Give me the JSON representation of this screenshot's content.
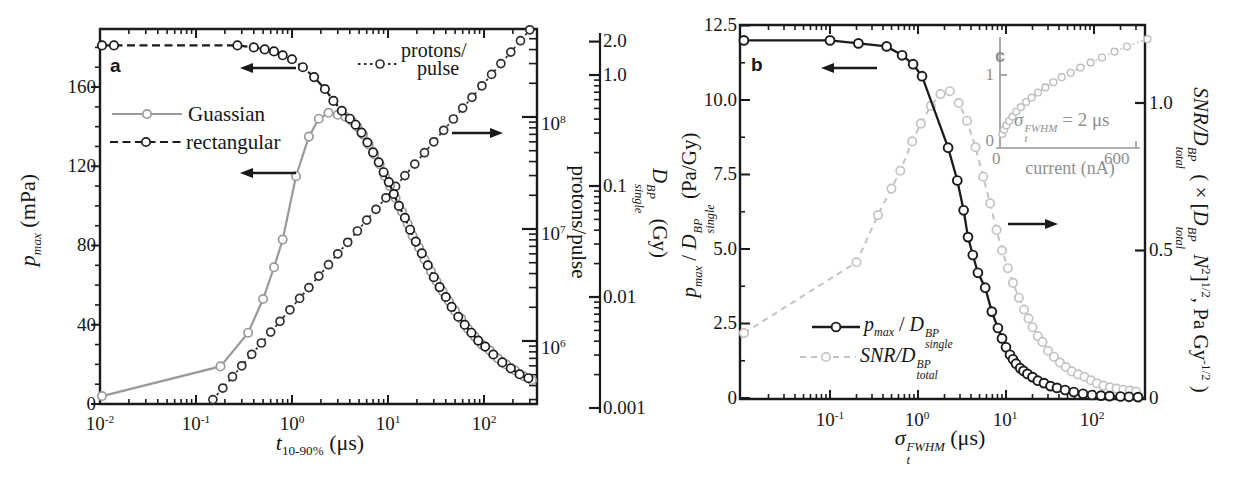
{
  "panel_a": {
    "label": "a",
    "legend": {
      "item1": "Guassian",
      "item2": "rectangular"
    },
    "series_callout": {
      "line1": "protons/",
      "line2": "pulse"
    },
    "y_left": {
      "label": {
        "var": "p",
        "sub": "max",
        "unit": " (mPa)"
      },
      "ticks": [
        "160",
        "120",
        "80",
        "40",
        "0"
      ]
    },
    "x_axis": {
      "label": {
        "var": "t",
        "sub": "10-90%",
        "unit": " (μs)"
      },
      "ticks": [
        {
          "base": "10",
          "exp": "-2"
        },
        {
          "base": "10",
          "exp": "-1"
        },
        {
          "base": "10",
          "exp": "0"
        },
        {
          "base": "10",
          "exp": "1"
        },
        {
          "base": "10",
          "exp": "2"
        }
      ]
    },
    "y_right": {
      "label": "protons/pulse",
      "ticks": [
        {
          "base": "10",
          "exp": "8"
        },
        {
          "base": "10",
          "exp": "7"
        },
        {
          "base": "10",
          "exp": "6"
        }
      ]
    },
    "y_right2": {
      "label": {
        "var": "D",
        "sup": "BP",
        "sub": "single",
        "unit": " (Gy)"
      },
      "ticks": [
        "2.0",
        "1.0",
        "0.1",
        "0.01",
        "0.001"
      ]
    }
  },
  "panel_b": {
    "label": "b",
    "y_left": {
      "label": {
        "var": "p",
        "sub": "max",
        "mid": " / ",
        "var2": "D",
        "sup2": "BP",
        "sub2": "single",
        "unit": " (Pa/Gy)"
      },
      "ticks": [
        "12.5",
        "10.0",
        "7.5",
        "5.0",
        "2.5",
        "0"
      ]
    },
    "x_axis": {
      "label": {
        "var": "σ",
        "sup": "FWHM",
        "sub": "t",
        "unit": " (μs)"
      },
      "ticks": [
        {
          "base": "10",
          "exp": "-1"
        },
        {
          "base": "10",
          "exp": "0"
        },
        {
          "base": "10",
          "exp": "1"
        },
        {
          "base": "10",
          "exp": "2"
        }
      ]
    },
    "y_right": {
      "label": {
        "s1": "SNR/D",
        "sup1": "BP",
        "sub1": "total",
        "s2": " ( × [",
        "s3": "D",
        "sup3": "BP",
        "sub3": "total",
        "s4": " N",
        "sup4": "2",
        "s5": "]",
        "sup5": "1/2",
        "s6": ", Pa Gy",
        "sup6": "-1/2",
        "s7": " )"
      },
      "ticks": [
        "1.0",
        "0.5",
        "0"
      ]
    },
    "legend": {
      "item1": {
        "var": "p",
        "sub": "max",
        "mid": " / ",
        "var2": "D",
        "sup2": "BP",
        "sub2": "single"
      },
      "item2": {
        "s": "SNR/D",
        "sup": "BP",
        "sub": "total"
      }
    },
    "inset": {
      "label": "c",
      "y_tick_1": "1",
      "y_tick_0": "0",
      "x_tick_0": "0",
      "x_tick_600": "600",
      "x_label": "current (nA)",
      "annotation": {
        "var": "σ",
        "sup": "FWHM",
        "sub": "t",
        "rest": " = 2 μs"
      }
    }
  },
  "chart_data": [
    {
      "id": "panel_a",
      "type": "line",
      "xlabel": "t_10-90% (μs)",
      "x_scale": "log",
      "x_range": [
        0.01,
        355
      ],
      "ylabel_left": "p_max (mPa)",
      "y_left_range": [
        0,
        190
      ],
      "ylabel_right": "protons/pulse",
      "y_right_scale": "log",
      "y_right_range": [
        300000.0,
        630000000.0
      ],
      "ylabel_right2": "D_single^BP (Gy)",
      "y_right2_scale": "log",
      "y_right2_range": [
        0.001,
        2.0
      ],
      "grid": false,
      "series": [
        {
          "name": "protons/pulse",
          "axis": "right",
          "line": "dotted",
          "color": "#2f2f2f",
          "points": [
            [
              0.15,
              300000.0
            ],
            [
              0.19,
              380000.0
            ],
            [
              0.24,
              480000.0
            ],
            [
              0.3,
              600000.0
            ],
            [
              0.38,
              760000.0
            ],
            [
              0.48,
              960000.0
            ],
            [
              0.6,
              1200000.0
            ],
            [
              0.75,
              1500000.0
            ],
            [
              0.95,
              1900000.0
            ],
            [
              1.2,
              2400000.0
            ],
            [
              1.5,
              3000000.0
            ],
            [
              1.9,
              3800000.0
            ],
            [
              2.4,
              4800000.0
            ],
            [
              3.0,
              6000000.0
            ],
            [
              3.8,
              7600000.0
            ],
            [
              4.8,
              9600000.0
            ],
            [
              6.0,
              12000000.0
            ],
            [
              7.5,
              15000000.0
            ],
            [
              9.5,
              19000000.0
            ],
            [
              12,
              24000000.0
            ],
            [
              15,
              30000000.0
            ],
            [
              19,
              38000000.0
            ],
            [
              24,
              48000000.0
            ],
            [
              30,
              60000000.0
            ],
            [
              38,
              76000000.0
            ],
            [
              48,
              96000000.0
            ],
            [
              60,
              120000000.0
            ],
            [
              75,
              150000000.0
            ],
            [
              95,
              190000000.0
            ],
            [
              120,
              240000000.0
            ],
            [
              150,
              300000000.0
            ],
            [
              190,
              380000000.0
            ],
            [
              240,
              480000000.0
            ],
            [
              300,
              600000000.0
            ]
          ]
        },
        {
          "name": "Guassian",
          "axis": "left",
          "line": "solid",
          "color": "#9a9a9a",
          "points": [
            [
              0.0105,
              4
            ],
            [
              0.18,
              19
            ],
            [
              0.35,
              36
            ],
            [
              0.5,
              53
            ],
            [
              0.65,
              69
            ],
            [
              0.8,
              83
            ],
            [
              1.1,
              115
            ],
            [
              1.5,
              135
            ],
            [
              1.9,
              144
            ],
            [
              2.4,
              147
            ],
            [
              3.0,
              146
            ],
            [
              3.6,
              145
            ],
            [
              4.2,
              143
            ],
            [
              4.8,
              140
            ],
            [
              5.5,
              136
            ],
            [
              6.3,
              131
            ],
            [
              7.2,
              126
            ],
            [
              8.2,
              121
            ],
            [
              9.3,
              115
            ],
            [
              10.5,
              110
            ],
            [
              12,
              104
            ],
            [
              14,
              97
            ],
            [
              16,
              91
            ],
            [
              18,
              85
            ],
            [
              21,
              79
            ],
            [
              24,
              73
            ],
            [
              28,
              67
            ],
            [
              32,
              62
            ],
            [
              37,
              57
            ],
            [
              43,
              52
            ],
            [
              50,
              47
            ],
            [
              58,
              43
            ],
            [
              68,
              38
            ],
            [
              80,
              34
            ],
            [
              95,
              30
            ],
            [
              115,
              27
            ],
            [
              140,
              23
            ],
            [
              170,
              20
            ],
            [
              210,
              17
            ],
            [
              260,
              14
            ],
            [
              316,
              12
            ]
          ]
        },
        {
          "name": "rectangular",
          "axis": "left",
          "line": "dashed",
          "color": "#1b1b1b",
          "points": [
            [
              0.0105,
              181
            ],
            [
              0.014,
              181
            ],
            [
              0.27,
              181
            ],
            [
              0.4,
              180
            ],
            [
              0.52,
              179
            ],
            [
              0.65,
              178
            ],
            [
              0.8,
              176
            ],
            [
              1.0,
              174
            ],
            [
              1.3,
              170
            ],
            [
              1.7,
              165
            ],
            [
              2.2,
              159
            ],
            [
              2.7,
              153
            ],
            [
              3.3,
              148
            ],
            [
              4.0,
              144
            ],
            [
              4.6,
              141
            ],
            [
              5.3,
              137
            ],
            [
              6.1,
              132
            ],
            [
              7.0,
              127
            ],
            [
              8.0,
              122
            ],
            [
              9.0,
              117
            ],
            [
              10.2,
              112
            ],
            [
              11.5,
              106
            ],
            [
              13,
              100
            ],
            [
              15,
              94
            ],
            [
              17,
              88
            ],
            [
              19.5,
              82
            ],
            [
              22.5,
              76
            ],
            [
              26,
              70
            ],
            [
              30,
              64
            ],
            [
              34.5,
              59
            ],
            [
              40,
              54
            ],
            [
              46,
              49
            ],
            [
              54,
              44
            ],
            [
              63,
              40
            ],
            [
              74,
              36
            ],
            [
              87,
              32
            ],
            [
              103,
              29
            ],
            [
              125,
              25
            ],
            [
              155,
              21
            ],
            [
              190,
              18
            ],
            [
              235,
              15
            ],
            [
              290,
              13
            ]
          ]
        }
      ]
    },
    {
      "id": "panel_b",
      "type": "line",
      "xlabel": "σ_t^FWHM (μs)",
      "x_scale": "log",
      "x_range": [
        0.01,
        400
      ],
      "ylabel_left": "p_max / D_single^BP (Pa/Gy)",
      "y_left_range": [
        0,
        12.5
      ],
      "ylabel_right": "SNR/D_total^BP ( × [D_total^BP N^2]^1/2, Pa Gy^-1/2 )",
      "y_right_range": [
        0,
        1.26
      ],
      "grid": false,
      "series": [
        {
          "name": "SNR/D_total^BP",
          "axis": "right",
          "line": "loosedash",
          "color": "#c3c3c3",
          "points": [
            [
              0.0105,
              0.22
            ],
            [
              0.2,
              0.46
            ],
            [
              0.35,
              0.62
            ],
            [
              0.5,
              0.71
            ],
            [
              0.63,
              0.77
            ],
            [
              0.86,
              0.87
            ],
            [
              1.08,
              0.93
            ],
            [
              1.4,
              0.99
            ],
            [
              1.8,
              1.03
            ],
            [
              2.3,
              1.04
            ],
            [
              2.9,
              1.0
            ],
            [
              3.6,
              0.94
            ],
            [
              4.5,
              0.85
            ],
            [
              5.5,
              0.75
            ],
            [
              6.6,
              0.66
            ],
            [
              7.8,
              0.57
            ],
            [
              9,
              0.5
            ],
            [
              10.5,
              0.44
            ],
            [
              12,
              0.39
            ],
            [
              14,
              0.34
            ],
            [
              16,
              0.3
            ],
            [
              18,
              0.27
            ],
            [
              20,
              0.24
            ],
            [
              23,
              0.21
            ],
            [
              26,
              0.19
            ],
            [
              30,
              0.16
            ],
            [
              35,
              0.14
            ],
            [
              41,
              0.12
            ],
            [
              48,
              0.105
            ],
            [
              56,
              0.09
            ],
            [
              66,
              0.08
            ],
            [
              78,
              0.072
            ],
            [
              92,
              0.06
            ],
            [
              108,
              0.05
            ],
            [
              128,
              0.042
            ],
            [
              152,
              0.036
            ],
            [
              180,
              0.032
            ],
            [
              215,
              0.028
            ],
            [
              255,
              0.025
            ],
            [
              300,
              0.022
            ]
          ]
        },
        {
          "name": "p_max / D_single^BP",
          "axis": "left",
          "line": "solid",
          "color": "#1b1b1b",
          "points": [
            [
              0.0105,
              12.0
            ],
            [
              0.1,
              12.0
            ],
            [
              0.21,
              11.9
            ],
            [
              0.44,
              11.8
            ],
            [
              0.66,
              11.5
            ],
            [
              0.88,
              11.2
            ],
            [
              1.11,
              10.8
            ],
            [
              2.2,
              8.4
            ],
            [
              2.8,
              7.3
            ],
            [
              3.3,
              6.3
            ],
            [
              3.7,
              5.4
            ],
            [
              4.2,
              4.8
            ],
            [
              4.8,
              4.2
            ],
            [
              5.8,
              3.7
            ],
            [
              6.9,
              2.9
            ],
            [
              8.1,
              2.35
            ],
            [
              9.0,
              2.0
            ],
            [
              10,
              1.7
            ],
            [
              11.1,
              1.45
            ],
            [
              12,
              1.3
            ],
            [
              13,
              1.15
            ],
            [
              14.5,
              1.0
            ],
            [
              15.8,
              0.91
            ],
            [
              17.5,
              0.81
            ],
            [
              20,
              0.7
            ],
            [
              23,
              0.58
            ],
            [
              27,
              0.5
            ],
            [
              32,
              0.4
            ],
            [
              38,
              0.34
            ],
            [
              47,
              0.27
            ],
            [
              59,
              0.2
            ],
            [
              75,
              0.14
            ],
            [
              95,
              0.1
            ],
            [
              120,
              0.08
            ],
            [
              150,
              0.065
            ],
            [
              200,
              0.05
            ],
            [
              250,
              0.04
            ],
            [
              316,
              0.03
            ]
          ]
        }
      ]
    },
    {
      "id": "inset_c",
      "type": "scatter",
      "xlabel": "current (nA)",
      "x_range": [
        0,
        600
      ],
      "y_tick": 1,
      "annotation": "σ_t^FWHM = 2 μs",
      "series": [
        {
          "name": "SNR vs current",
          "line": "dotted",
          "color": "#bdbdbd",
          "points": [
            [
              10,
              0.19
            ],
            [
              18,
              0.25
            ],
            [
              28,
              0.31
            ],
            [
              40,
              0.37
            ],
            [
              55,
              0.43
            ],
            [
              72,
              0.5
            ],
            [
              92,
              0.56
            ],
            [
              115,
              0.63
            ],
            [
              140,
              0.69
            ],
            [
              168,
              0.76
            ],
            [
              200,
              0.83
            ],
            [
              235,
              0.9
            ],
            [
              272,
              0.97
            ],
            [
              312,
              1.03
            ],
            [
              355,
              1.1
            ],
            [
              400,
              1.17
            ],
            [
              450,
              1.24
            ],
            [
              505,
              1.32
            ],
            [
              560,
              1.39
            ],
            [
              650,
              1.49
            ]
          ]
        }
      ]
    }
  ]
}
